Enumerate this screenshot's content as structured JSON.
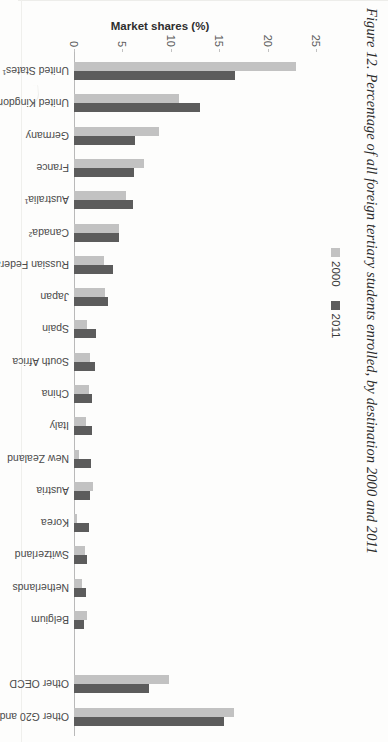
{
  "figure": {
    "title": "Figure 12. Percentage of all foreign tertiary students enrolled, by destination 2000 and 2011"
  },
  "legend": {
    "items": [
      {
        "label": "2000",
        "color": "#c2c2c2"
      },
      {
        "label": "2011",
        "color": "#5c5c5c"
      }
    ]
  },
  "axis": {
    "y_title": "Market shares (%)",
    "ticks": [
      "0",
      "5",
      "10",
      "15",
      "20",
      "25"
    ]
  },
  "chart_data": {
    "type": "bar",
    "title": "Figure 12. Percentage of all foreign tertiary students enrolled, by destination 2000 and 2011",
    "xlabel": "",
    "ylabel": "Market shares (%)",
    "ylim": [
      0,
      25
    ],
    "grid": false,
    "legend_position": "top",
    "orientation": "vertical",
    "categories": [
      "United States¹",
      "United Kingdom¹",
      "Germany",
      "France",
      "Australia¹",
      "Canada²",
      "Russian Federation",
      "Japan",
      "Spain",
      "South Africa",
      "China",
      "Italy",
      "New Zealand",
      "Austria",
      "Korea",
      "Switzerland",
      "Netherlands",
      "Belgium",
      "",
      "Other OECD",
      "Other G20 and non-OECD"
    ],
    "series": [
      {
        "name": "2000",
        "color": "#c2c2c2",
        "values": [
          22.9,
          10.8,
          8.8,
          7.2,
          5.4,
          4.6,
          3.1,
          3.2,
          1.3,
          1.7,
          1.6,
          1.2,
          0.5,
          2.0,
          0.3,
          1.1,
          0.8,
          1.3,
          null,
          9.8,
          16.5
        ]
      },
      {
        "name": "2011",
        "color": "#5c5c5c",
        "values": [
          16.6,
          13.0,
          6.3,
          6.2,
          6.1,
          4.7,
          4.0,
          3.5,
          2.3,
          2.2,
          1.9,
          1.9,
          1.8,
          1.7,
          1.5,
          1.3,
          1.2,
          1.0,
          null,
          7.8,
          15.5
        ]
      }
    ],
    "notes": []
  }
}
